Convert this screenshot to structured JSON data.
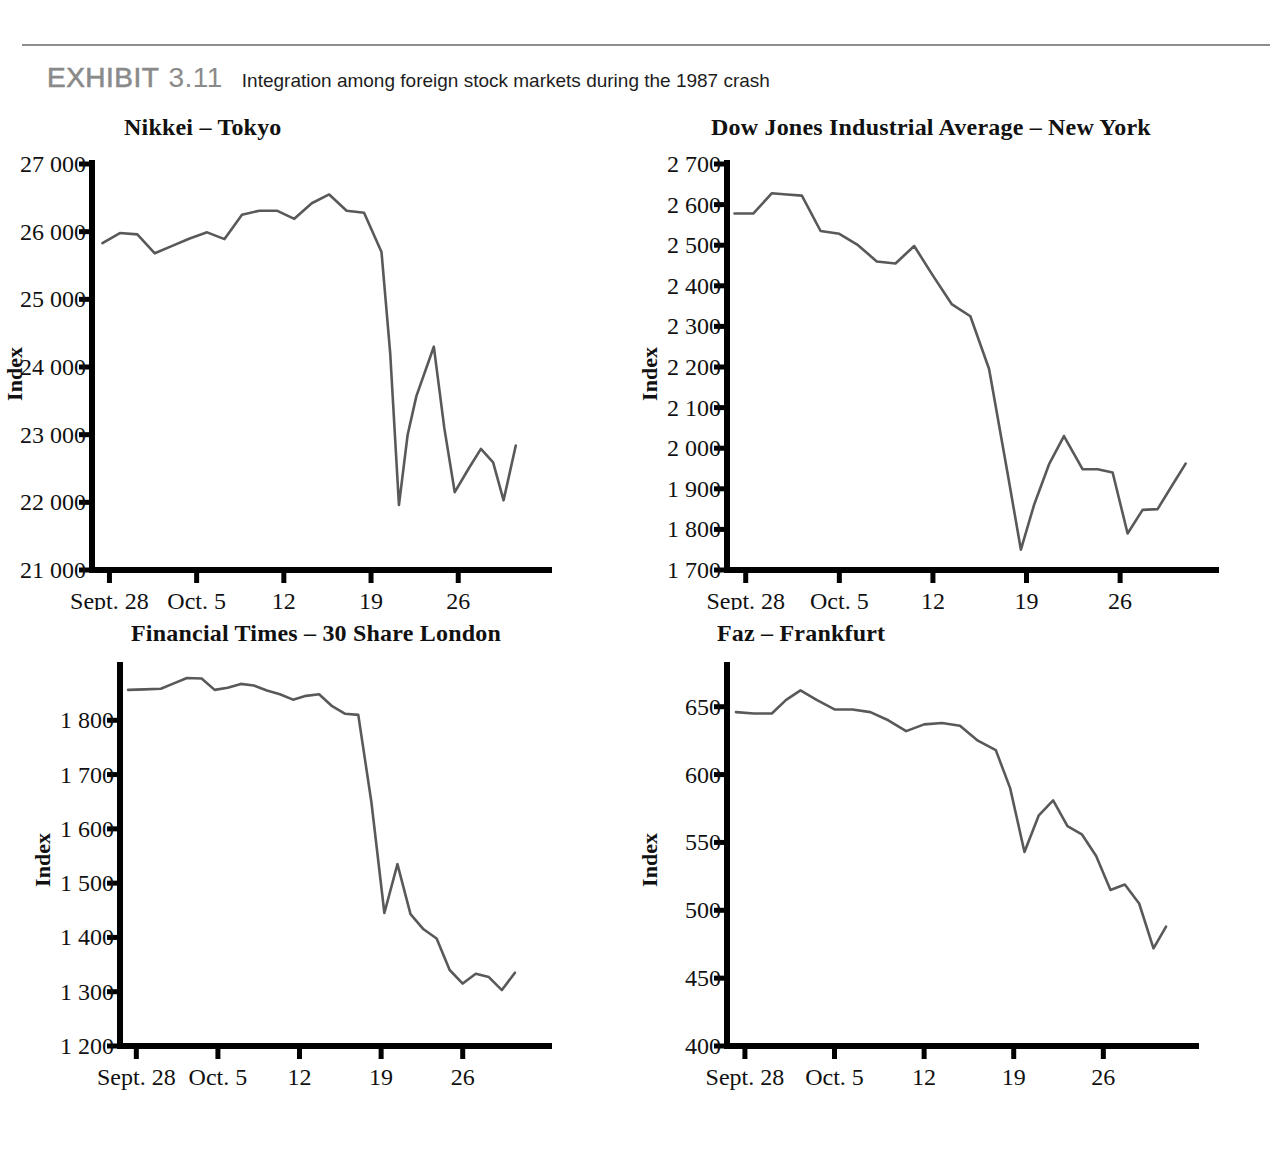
{
  "exhibit": {
    "label_word": "EXHIBIT",
    "label_number": "3.11",
    "caption": "Integration among foreign stock markets during the 1987 crash"
  },
  "axis_common": {
    "y_title": "Index",
    "x_tick_labels": [
      "Sept. 28",
      "Oct. 5",
      "12",
      "19",
      "26"
    ]
  },
  "chart_data": [
    {
      "id": "nikkei",
      "type": "line",
      "title": "Nikkei – Tokyo",
      "xlabel": "",
      "ylabel": "Index",
      "ylim": [
        21000,
        27000
      ],
      "ytick_values": [
        21000,
        22000,
        23000,
        24000,
        25000,
        26000,
        27000
      ],
      "ytick_labels": [
        "21 000",
        "22 000",
        "23 000",
        "24 000",
        "25 000",
        "26 000",
        "27 000"
      ],
      "xtick_positions": [
        1,
        6,
        11,
        16,
        21
      ],
      "xtick_labels": [
        "Sept. 28",
        "Oct. 5",
        "12",
        "19",
        "26"
      ],
      "xlim": [
        0,
        25
      ],
      "grid": false,
      "legend": "none",
      "x": [
        0.6,
        1.6,
        2.6,
        3.6,
        4.6,
        5.6,
        6.6,
        7.6,
        8.6,
        9.6,
        10.6,
        11.6,
        12.6,
        13.6,
        14.6,
        15.6,
        16.6,
        17.1,
        17.6,
        18.1,
        18.6,
        19.6,
        20.2,
        20.8,
        21.6,
        22.3,
        23.0,
        23.6,
        24.3
      ],
      "values": [
        25830,
        25980,
        25960,
        25680,
        25790,
        25900,
        25990,
        25890,
        26250,
        26310,
        26310,
        26190,
        26420,
        26550,
        26310,
        26280,
        25700,
        24200,
        21960,
        23000,
        23570,
        24300,
        23100,
        22150,
        22500,
        22790,
        22590,
        22030,
        22840
      ]
    },
    {
      "id": "dow",
      "type": "line",
      "title": "Dow Jones Industrial Average – New York",
      "xlabel": "",
      "ylabel": "Index",
      "ylim": [
        1700,
        2700
      ],
      "ytick_values": [
        1700,
        1800,
        1900,
        2000,
        2100,
        2200,
        2300,
        2400,
        2500,
        2600,
        2700
      ],
      "ytick_labels": [
        "1 700",
        "1 800",
        "1 900",
        "2 000",
        "2 100",
        "2 200",
        "2 300",
        "2 400",
        "2 500",
        "2 600",
        "2 700"
      ],
      "xtick_positions": [
        1,
        6,
        11,
        16,
        21
      ],
      "xtick_labels": [
        "Sept. 28",
        "Oct. 5",
        "12",
        "19",
        "26"
      ],
      "xlim": [
        0,
        25
      ],
      "grid": false,
      "legend": "none",
      "x": [
        0.4,
        1.4,
        2.4,
        3.2,
        4.0,
        5.0,
        6.0,
        7.0,
        8.0,
        9.0,
        10.0,
        11.0,
        12.0,
        13.0,
        14.0,
        15.0,
        15.7,
        16.4,
        17.2,
        18.0,
        19.0,
        19.8,
        20.6,
        21.4,
        22.2,
        23.0,
        23.8,
        24.5
      ],
      "values": [
        2578,
        2578,
        2628,
        2625,
        2622,
        2535,
        2528,
        2500,
        2460,
        2455,
        2498,
        2425,
        2355,
        2325,
        2195,
        1935,
        1750,
        1860,
        1960,
        2030,
        1948,
        1948,
        1940,
        1790,
        1848,
        1850,
        1910,
        1962
      ]
    },
    {
      "id": "london",
      "type": "line",
      "title": "Financial Times – 30 Share London",
      "xlabel": "",
      "ylabel": "Index",
      "ylim": [
        1200,
        1900
      ],
      "ytick_values": [
        1200,
        1300,
        1400,
        1500,
        1600,
        1700,
        1800
      ],
      "ytick_labels": [
        "1 200",
        "1 300",
        "1 400",
        "1 500",
        "1 600",
        "1 700",
        "1 800"
      ],
      "xtick_positions": [
        1,
        6,
        11,
        16,
        21
      ],
      "xtick_labels": [
        "Sept. 28",
        "Oct. 5",
        "12",
        "19",
        "26"
      ],
      "xlim": [
        0,
        25
      ],
      "grid": false,
      "legend": "none",
      "x": [
        0.5,
        1.5,
        2.5,
        3.3,
        4.1,
        5.0,
        5.8,
        6.6,
        7.4,
        8.2,
        9.0,
        9.8,
        10.6,
        11.4,
        12.2,
        13.0,
        13.8,
        14.6,
        15.4,
        16.2,
        17.0,
        17.8,
        18.6,
        19.4,
        20.2,
        21.0,
        21.8,
        22.6,
        23.4,
        24.2
      ],
      "values": [
        1856,
        1857,
        1858,
        1868,
        1878,
        1877,
        1856,
        1860,
        1867,
        1864,
        1855,
        1848,
        1838,
        1845,
        1848,
        1826,
        1812,
        1810,
        1650,
        1445,
        1535,
        1443,
        1415,
        1398,
        1340,
        1315,
        1333,
        1327,
        1303,
        1335
      ]
    },
    {
      "id": "frankfurt",
      "type": "line",
      "title": "Faz – Frankfurt",
      "xlabel": "",
      "ylabel": "Index",
      "ylim": [
        400,
        680
      ],
      "ytick_values": [
        400,
        450,
        500,
        550,
        600,
        650
      ],
      "ytick_labels": [
        "400",
        "450",
        "500",
        "550",
        "600",
        "650"
      ],
      "xtick_positions": [
        1,
        6,
        11,
        16,
        21
      ],
      "xtick_labels": [
        "Sept. 28",
        "Oct. 5",
        "12",
        "19",
        "26"
      ],
      "xlim": [
        0,
        25
      ],
      "grid": false,
      "legend": "none",
      "x": [
        0.5,
        1.5,
        2.5,
        3.3,
        4.1,
        5.0,
        6.0,
        7.0,
        8.0,
        9.0,
        10.0,
        11.0,
        12.0,
        13.0,
        14.0,
        15.0,
        15.8,
        16.6,
        17.4,
        18.2,
        19.0,
        19.8,
        20.6,
        21.4,
        22.2,
        23.0,
        23.8,
        24.5
      ],
      "values": [
        646,
        645,
        645,
        655,
        662,
        655,
        648,
        648,
        646,
        640,
        632,
        637,
        638,
        636,
        625,
        618,
        590,
        543,
        570,
        581,
        562,
        556,
        540,
        515,
        519,
        505,
        472,
        488
      ]
    }
  ]
}
